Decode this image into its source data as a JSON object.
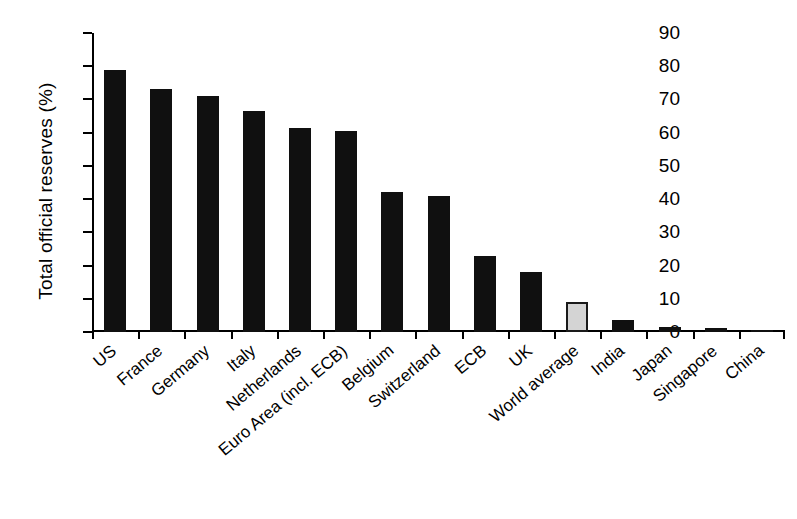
{
  "chart_data": {
    "type": "bar",
    "title": "",
    "subtitle": "",
    "xlabel": "",
    "ylabel": "Total official reserves (%)",
    "ylim": [
      0,
      90
    ],
    "yticks": [
      0,
      10,
      20,
      30,
      40,
      50,
      60,
      70,
      80,
      90
    ],
    "grid": false,
    "legend": "none",
    "categories": [
      "US",
      "France",
      "Germany",
      "Italy",
      "Netherlands",
      "Euro Area (incl. ECB)",
      "Belgium",
      "Switzerland",
      "ECB",
      "UK",
      "World average",
      "India",
      "Japan",
      "Singapore",
      "China"
    ],
    "values": [
      79,
      73,
      71,
      66.5,
      61.5,
      60.5,
      42,
      41,
      23,
      18,
      9,
      3.5,
      1.5,
      1.3,
      0.6
    ],
    "bar_colors": [
      "#101010",
      "#101010",
      "#101010",
      "#101010",
      "#101010",
      "#101010",
      "#101010",
      "#101010",
      "#101010",
      "#101010",
      "#d4d4d4",
      "#101010",
      "#101010",
      "#101010",
      "#101010"
    ],
    "highlight_category": "World average",
    "highlight_color": "#d4d4d4",
    "series_color": "#101010",
    "annotations": []
  }
}
